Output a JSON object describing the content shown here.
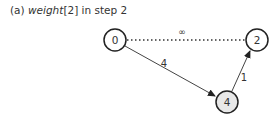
{
  "caption": {
    "prefix": "(a) ",
    "italic": "weight",
    "suffix": "[2] in step 2"
  },
  "graph": {
    "nodes": [
      {
        "id": "n0",
        "label": "0",
        "x": 115,
        "y": 40,
        "fill": "#ffffff"
      },
      {
        "id": "n2",
        "label": "2",
        "x": 257,
        "y": 40,
        "fill": "#ffffff"
      },
      {
        "id": "n4",
        "label": "4",
        "x": 227,
        "y": 102,
        "fill": "#e8e8e8"
      }
    ],
    "edges": [
      {
        "from": "n0",
        "to": "n2",
        "label": "∞",
        "style": "dotted",
        "arrow": false
      },
      {
        "from": "n0",
        "to": "n4",
        "label": "4",
        "style": "solid",
        "arrow": true
      },
      {
        "from": "n4",
        "to": "n2",
        "label": "1",
        "style": "solid",
        "arrow": true
      }
    ]
  }
}
